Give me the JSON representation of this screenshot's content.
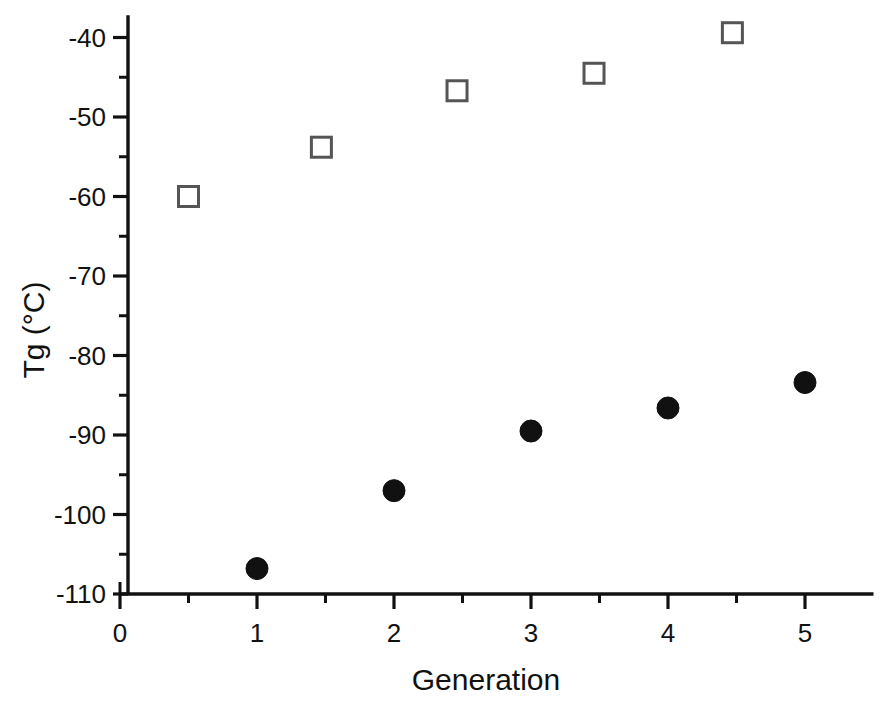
{
  "artifacts": {
    "page_number_fragment": "312",
    "header_fragment": "CHAPTER HEADING"
  },
  "chart_data": {
    "type": "scatter",
    "title": "",
    "xlabel": "Generation",
    "ylabel": "Tg (°C)",
    "xlim": [
      0,
      5.5
    ],
    "ylim": [
      -110,
      -37
    ],
    "grid": false,
    "legend": "none",
    "x_ticks_major": [
      0,
      1,
      2,
      3,
      4,
      5
    ],
    "x_tick_labels": [
      "0",
      "1",
      "2",
      "3",
      "4",
      "5"
    ],
    "x_ticks_minor": [
      0.5,
      1.5,
      2.5,
      3.5,
      4.5
    ],
    "y_ticks_major": [
      -40,
      -50,
      -60,
      -70,
      -80,
      -90,
      -100,
      -110
    ],
    "y_tick_labels": [
      "-40",
      "-50",
      "-60",
      "-70",
      "-80",
      "-90",
      "-100",
      "-110"
    ],
    "y_ticks_minor": [
      -45,
      -55,
      -65,
      -75,
      -85,
      -95,
      -105
    ],
    "series": [
      {
        "name": "filled-circle-series",
        "marker": "filled-circle",
        "color": "#111111",
        "points": [
          {
            "x": 1,
            "y": -106.8
          },
          {
            "x": 2,
            "y": -97.0
          },
          {
            "x": 3,
            "y": -89.5
          },
          {
            "x": 4,
            "y": -86.6
          },
          {
            "x": 5,
            "y": -83.4
          }
        ]
      },
      {
        "name": "open-square-series",
        "marker": "open-square",
        "color": "#555555",
        "points": [
          {
            "x": 0.5,
            "y": -60.0
          },
          {
            "x": 1.47,
            "y": -53.8
          },
          {
            "x": 2.46,
            "y": -46.7
          },
          {
            "x": 3.46,
            "y": -44.5
          },
          {
            "x": 4.47,
            "y": -39.4
          }
        ]
      }
    ]
  }
}
